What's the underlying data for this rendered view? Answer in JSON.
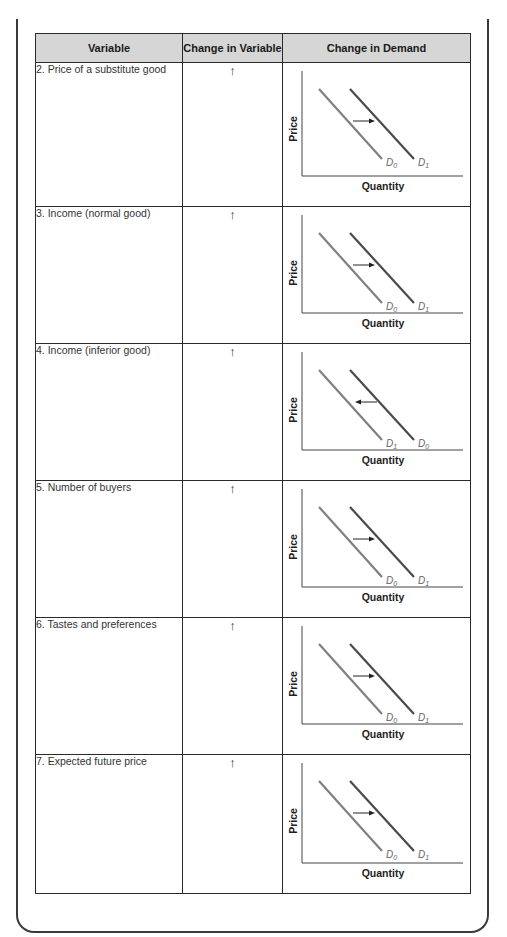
{
  "table": {
    "headers": [
      "Variable",
      "Change in Variable",
      "Change in Demand"
    ],
    "rows": [
      {
        "variable": "2.  Price of a substitute good",
        "change": "↑",
        "shift": "right",
        "left_label": "D",
        "left_sub": "0",
        "right_label": "D",
        "right_sub": "1"
      },
      {
        "variable": "3.  Income (normal good)",
        "change": "↑",
        "shift": "right",
        "left_label": "D",
        "left_sub": "0",
        "right_label": "D",
        "right_sub": "1"
      },
      {
        "variable": "4.  Income (inferior good)",
        "change": "↑",
        "shift": "left",
        "left_label": "D",
        "left_sub": "1",
        "right_label": "D",
        "right_sub": "0"
      },
      {
        "variable": "5.  Number of buyers",
        "change": "↑",
        "shift": "right",
        "left_label": "D",
        "left_sub": "0",
        "right_label": "D",
        "right_sub": "1"
      },
      {
        "variable": "6.  Tastes and preferences",
        "change": "↑",
        "shift": "right",
        "left_label": "D",
        "left_sub": "0",
        "right_label": "D",
        "right_sub": "1"
      },
      {
        "variable": "7.  Expected future price",
        "change": "↑",
        "shift": "right",
        "left_label": "D",
        "left_sub": "0",
        "right_label": "D",
        "right_sub": "1"
      }
    ]
  },
  "chart_labels": {
    "y_axis": "Price",
    "x_axis": "Quantity"
  },
  "colors": {
    "header_bg": "#d6d6d6",
    "light_curve": "#808080",
    "dark_curve": "#4a4a4a",
    "border": "#2a2a2a"
  }
}
